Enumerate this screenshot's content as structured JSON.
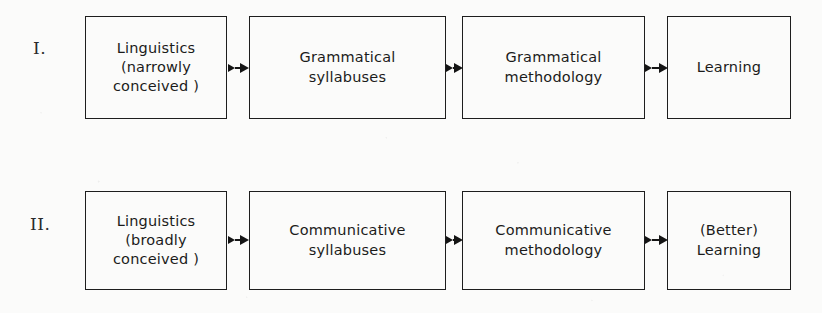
{
  "figure": {
    "background_color": "#fbfbfa",
    "ink_color": "#1b1b1b",
    "rows": [
      {
        "numeral": "I.",
        "nodes": [
          {
            "id": "linguistics-narrow",
            "label": "Linguistics\n(narrowly\nconceived )"
          },
          {
            "id": "grammatical-syllabuses",
            "label": "Grammatical\nsyllabuses"
          },
          {
            "id": "grammatical-methodology",
            "label": "Grammatical\nmethodology"
          },
          {
            "id": "learning",
            "label": "Learning"
          }
        ],
        "arrows": [
          {
            "from": "linguistics-narrow",
            "to": "grammatical-syllabuses"
          },
          {
            "from": "grammatical-syllabuses",
            "to": "grammatical-methodology"
          },
          {
            "from": "grammatical-methodology",
            "to": "learning"
          }
        ]
      },
      {
        "numeral": "II.",
        "nodes": [
          {
            "id": "linguistics-broad",
            "label": "Linguistics\n(broadly\nconceived )"
          },
          {
            "id": "communicative-syllabuses",
            "label": "Communicative\nsyllabuses"
          },
          {
            "id": "communicative-methodology",
            "label": "Communicative\nmethodology"
          },
          {
            "id": "better-learning",
            "label": "(Better)\nLearning"
          }
        ],
        "arrows": [
          {
            "from": "linguistics-broad",
            "to": "communicative-syllabuses"
          },
          {
            "from": "communicative-syllabuses",
            "to": "communicative-methodology"
          },
          {
            "from": "communicative-methodology",
            "to": "better-learning"
          }
        ]
      }
    ]
  }
}
